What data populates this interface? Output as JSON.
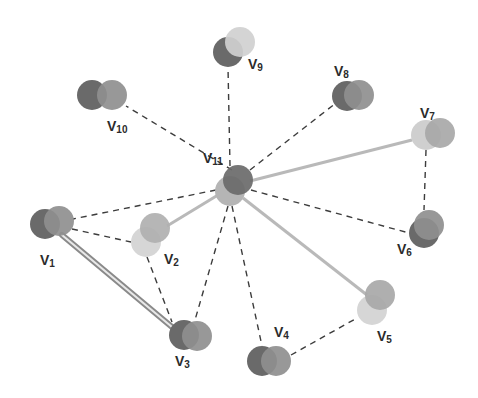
{
  "diagram": {
    "type": "graph",
    "colors": {
      "node_dark": "#6a6a6a",
      "node_mid": "#8f8f8f",
      "node_light": "#b5b5b5",
      "node_pale": "#d6d6d6",
      "edge_dashed": "#3c3c3c",
      "edge_solid": "#b9b9b9",
      "edge_double": "#8a8a8a",
      "label": "#2b2b2b"
    },
    "nodes": [
      {
        "id": "V1",
        "base": "V",
        "sub": "1",
        "back": {
          "x": 45,
          "y": 224,
          "fill": "#6a6a6a"
        },
        "front": {
          "x": 59,
          "y": 221,
          "fill": "#8f8f8f"
        },
        "label_pos": {
          "x": 40,
          "y": 265
        }
      },
      {
        "id": "V2",
        "base": "V",
        "sub": "2",
        "back": {
          "x": 146,
          "y": 242,
          "fill": "#d6d6d6"
        },
        "front": {
          "x": 155,
          "y": 228,
          "fill": "#b0b0b0"
        },
        "label_pos": {
          "x": 164,
          "y": 264
        }
      },
      {
        "id": "V3",
        "base": "V",
        "sub": "3",
        "back": {
          "x": 184,
          "y": 335,
          "fill": "#6a6a6a"
        },
        "front": {
          "x": 197,
          "y": 336,
          "fill": "#8f8f8f"
        },
        "label_pos": {
          "x": 175,
          "y": 366
        }
      },
      {
        "id": "V4",
        "base": "V",
        "sub": "4",
        "back": {
          "x": 262,
          "y": 361,
          "fill": "#6a6a6a"
        },
        "front": {
          "x": 276,
          "y": 361,
          "fill": "#8f8f8f"
        },
        "label_pos": {
          "x": 274,
          "y": 337
        }
      },
      {
        "id": "V5",
        "base": "V",
        "sub": "5",
        "back": {
          "x": 372,
          "y": 310,
          "fill": "#d6d6d6"
        },
        "front": {
          "x": 380,
          "y": 295,
          "fill": "#a8a8a8"
        },
        "label_pos": {
          "x": 377,
          "y": 341
        }
      },
      {
        "id": "V6",
        "base": "V",
        "sub": "6",
        "back": {
          "x": 424,
          "y": 233,
          "fill": "#6a6a6a"
        },
        "front": {
          "x": 429,
          "y": 225,
          "fill": "#8f8f8f"
        },
        "label_pos": {
          "x": 397,
          "y": 254
        }
      },
      {
        "id": "V7",
        "base": "V",
        "sub": "7",
        "back": {
          "x": 426,
          "y": 135,
          "fill": "#cfcfcf"
        },
        "front": {
          "x": 440,
          "y": 133,
          "fill": "#a8a8a8"
        },
        "label_pos": {
          "x": 420,
          "y": 118
        }
      },
      {
        "id": "V8",
        "base": "V",
        "sub": "8",
        "back": {
          "x": 347,
          "y": 96,
          "fill": "#6a6a6a"
        },
        "front": {
          "x": 359,
          "y": 95,
          "fill": "#8f8f8f"
        },
        "label_pos": {
          "x": 334,
          "y": 76
        }
      },
      {
        "id": "V9",
        "base": "V",
        "sub": "9",
        "back": {
          "x": 228,
          "y": 52,
          "fill": "#6a6a6a"
        },
        "front": {
          "x": 240,
          "y": 42,
          "fill": "#d0d0d0"
        },
        "label_pos": {
          "x": 248,
          "y": 69
        }
      },
      {
        "id": "V10",
        "base": "V",
        "sub": "10",
        "back": {
          "x": 92,
          "y": 95,
          "fill": "#6a6a6a"
        },
        "front": {
          "x": 112,
          "y": 95,
          "fill": "#8f8f8f"
        },
        "label_pos": {
          "x": 107,
          "y": 131
        }
      },
      {
        "id": "V11",
        "base": "V",
        "sub": "11",
        "back": {
          "x": 230,
          "y": 191,
          "fill": "#b5b5b5"
        },
        "front": {
          "x": 238,
          "y": 180,
          "fill": "#6a6a6a"
        },
        "label_pos": {
          "x": 203,
          "y": 163
        }
      }
    ],
    "node_radius": 15,
    "edges": [
      {
        "from": "V11",
        "to": "V10",
        "style": "dashed",
        "x1": 232,
        "y1": 170,
        "x2": 126,
        "y2": 106
      },
      {
        "from": "V11",
        "to": "V9",
        "style": "dashed",
        "x1": 230,
        "y1": 166,
        "x2": 228,
        "y2": 67
      },
      {
        "from": "V11",
        "to": "V8",
        "style": "dashed",
        "x1": 250,
        "y1": 170,
        "x2": 336,
        "y2": 103
      },
      {
        "from": "V11",
        "to": "V7",
        "style": "solid",
        "x1": 250,
        "y1": 181,
        "x2": 412,
        "y2": 140
      },
      {
        "from": "V7",
        "to": "V6",
        "style": "dashed",
        "x1": 426,
        "y1": 150,
        "x2": 424,
        "y2": 210
      },
      {
        "from": "V11",
        "to": "V6",
        "style": "dashed",
        "x1": 251,
        "y1": 190,
        "x2": 409,
        "y2": 233
      },
      {
        "from": "V11",
        "to": "V5",
        "style": "solid",
        "x1": 243,
        "y1": 198,
        "x2": 367,
        "y2": 295
      },
      {
        "from": "V11",
        "to": "V4",
        "style": "dashed",
        "x1": 232,
        "y1": 206,
        "x2": 262,
        "y2": 346
      },
      {
        "from": "V11",
        "to": "V3",
        "style": "dashed",
        "x1": 228,
        "y1": 206,
        "x2": 195,
        "y2": 320
      },
      {
        "from": "V11",
        "to": "V2",
        "style": "solid",
        "x1": 218,
        "y1": 195,
        "x2": 167,
        "y2": 226
      },
      {
        "from": "V11",
        "to": "V1",
        "style": "dashed",
        "x1": 216,
        "y1": 190,
        "x2": 73,
        "y2": 219
      },
      {
        "from": "V1",
        "to": "V2",
        "style": "dashed",
        "x1": 72,
        "y1": 229,
        "x2": 131,
        "y2": 242
      },
      {
        "from": "V2",
        "to": "V3",
        "style": "dashed",
        "x1": 147,
        "y1": 257,
        "x2": 172,
        "y2": 322
      },
      {
        "from": "V4",
        "to": "V5",
        "style": "dashed",
        "x1": 291,
        "y1": 355,
        "x2": 357,
        "y2": 318
      },
      {
        "from": "V1",
        "to": "V3",
        "style": "double",
        "x1": 62,
        "y1": 235,
        "x2": 172,
        "y2": 327
      }
    ]
  }
}
